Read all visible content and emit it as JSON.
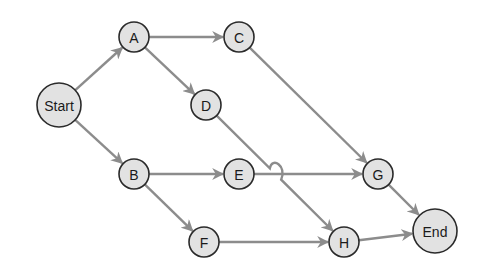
{
  "diagram": {
    "type": "network-activity-diagram",
    "nodes": [
      {
        "id": "Start",
        "label": "Start",
        "x": 59,
        "y": 105,
        "r": 22
      },
      {
        "id": "A",
        "label": "A",
        "x": 134,
        "y": 37,
        "r": 15
      },
      {
        "id": "B",
        "label": "B",
        "x": 134,
        "y": 174,
        "r": 15
      },
      {
        "id": "C",
        "label": "C",
        "x": 239,
        "y": 37,
        "r": 15
      },
      {
        "id": "D",
        "label": "D",
        "x": 206,
        "y": 105,
        "r": 15
      },
      {
        "id": "E",
        "label": "E",
        "x": 239,
        "y": 174,
        "r": 15
      },
      {
        "id": "F",
        "label": "F",
        "x": 204,
        "y": 242,
        "r": 15
      },
      {
        "id": "G",
        "label": "G",
        "x": 378,
        "y": 174,
        "r": 15
      },
      {
        "id": "H",
        "label": "H",
        "x": 344,
        "y": 242,
        "r": 15
      },
      {
        "id": "End",
        "label": "End",
        "x": 435,
        "y": 231,
        "r": 22
      }
    ],
    "edges": [
      {
        "from": "Start",
        "to": "A"
      },
      {
        "from": "Start",
        "to": "B"
      },
      {
        "from": "A",
        "to": "C"
      },
      {
        "from": "A",
        "to": "D"
      },
      {
        "from": "B",
        "to": "E"
      },
      {
        "from": "B",
        "to": "F"
      },
      {
        "from": "C",
        "to": "G"
      },
      {
        "from": "D",
        "to": "H"
      },
      {
        "from": "E",
        "to": "G"
      },
      {
        "from": "F",
        "to": "H"
      },
      {
        "from": "G",
        "to": "End"
      },
      {
        "from": "H",
        "to": "End"
      }
    ],
    "colors": {
      "node_fill": "#e2e2e2",
      "node_stroke": "#2a2a2a",
      "edge": "#8c8c8c",
      "background": "#ffffff"
    }
  }
}
